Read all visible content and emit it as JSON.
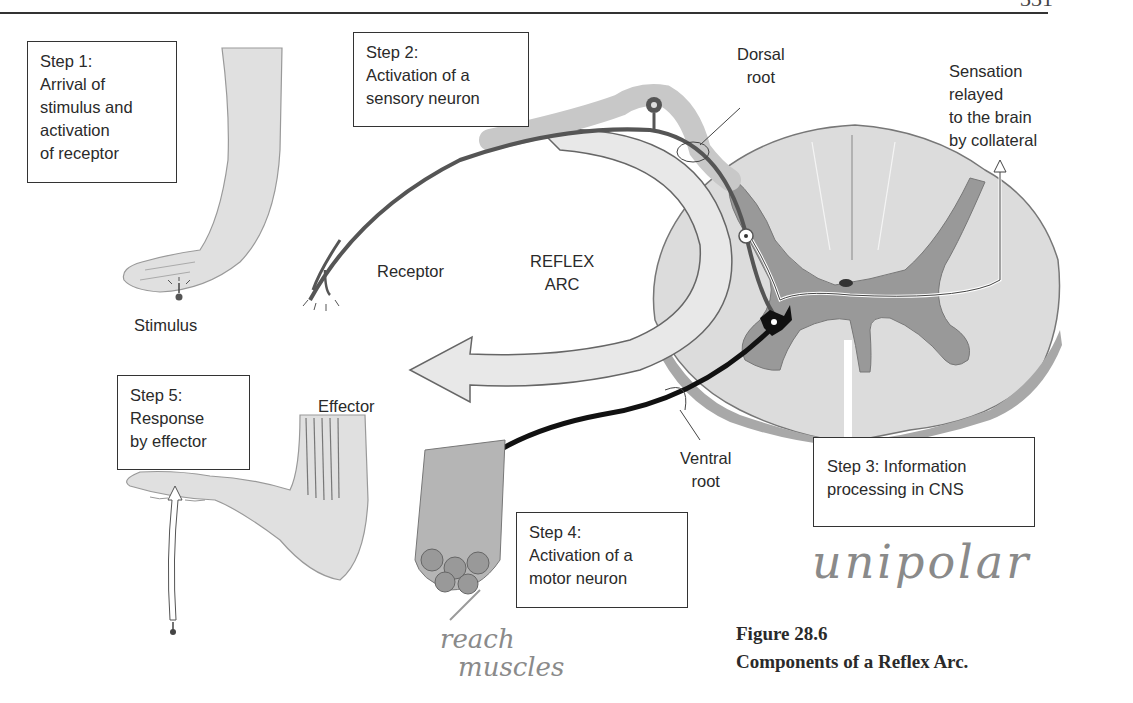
{
  "page": {
    "page_number_partial": "331"
  },
  "steps": {
    "step1": {
      "title": "Step 1:",
      "lines": [
        "Arrival of",
        "stimulus and",
        "activation",
        "of receptor"
      ]
    },
    "step2": {
      "title": "Step 2:",
      "lines": [
        "Activation of a",
        "sensory neuron"
      ]
    },
    "step3": {
      "lines": [
        "Step 3: Information",
        "processing in CNS"
      ]
    },
    "step4": {
      "title": "Step 4:",
      "lines": [
        "Activation of a",
        "motor neuron"
      ]
    },
    "step5": {
      "title": "Step 5:",
      "lines": [
        "Response",
        "by effector"
      ]
    }
  },
  "labels": {
    "stimulus": "Stimulus",
    "receptor": "Receptor",
    "reflex_arc": [
      "REFLEX",
      "ARC"
    ],
    "dorsal_root": [
      "Dorsal",
      "root"
    ],
    "ventral_root": [
      "Ventral",
      "root"
    ],
    "sensation": [
      "Sensation",
      "relayed",
      "to the brain",
      "by collateral"
    ],
    "effector": "Effector"
  },
  "caption": {
    "figure_number": "Figure 28.6",
    "title": "Components of a Reflex Arc."
  },
  "handwriting": {
    "note_step3": "unipolar",
    "note_step4": [
      "reach",
      "muscles"
    ]
  },
  "colors": {
    "text": "#2a2a2a",
    "gray_matter": "#9a9a9a",
    "white_matter": "#d9d9d9",
    "arrow_fill": "#e6e6e6",
    "skin": "#e2e2e2",
    "motor_neuron": "#111111",
    "pencil": "#8a8a8a"
  }
}
